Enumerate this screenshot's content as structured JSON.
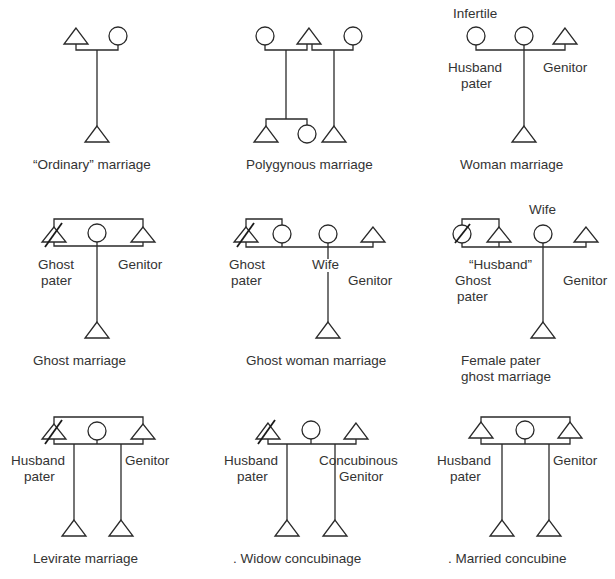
{
  "figure": {
    "type": "kinship-diagrams",
    "colors": {
      "stroke": "#2a2a2a",
      "text": "#333333",
      "background": "#ffffff"
    },
    "panels": [
      {
        "id": "ordinary",
        "caption": "“Ordinary” marriage",
        "labels": []
      },
      {
        "id": "polygynous",
        "caption": "Polygynous marriage",
        "labels": []
      },
      {
        "id": "woman",
        "caption": "Woman marriage",
        "labels": {
          "infertile": "Infertile",
          "husband": "Husband",
          "pater": "pater",
          "genitor": "Genitor"
        }
      },
      {
        "id": "ghost",
        "caption": "Ghost marriage",
        "labels": {
          "ghost": "Ghost",
          "pater": "pater",
          "genitor": "Genitor"
        }
      },
      {
        "id": "ghost-woman",
        "caption": "Ghost woman marriage",
        "labels": {
          "ghost": "Ghost",
          "pater": "pater",
          "wife": "Wife",
          "genitor": "Genitor"
        }
      },
      {
        "id": "female-pater-ghost",
        "caption_line1": "Female pater",
        "caption_line2": "ghost marriage",
        "labels": {
          "wife": "Wife",
          "husband": "“Husband”",
          "ghost": "Ghost",
          "pater": "pater",
          "genitor": "Genitor"
        }
      },
      {
        "id": "levirate",
        "caption": "Levirate marriage",
        "labels": {
          "husband": "Husband",
          "pater": "pater",
          "genitor": "Genitor"
        }
      },
      {
        "id": "widow-concubinage",
        "caption": ".  Widow concubinage",
        "labels": {
          "husband": "Husband",
          "pater": "pater",
          "concubinous": "Concubinous",
          "genitor": "Genitor"
        }
      },
      {
        "id": "married-concubine",
        "caption": ".  Married concubine",
        "labels": {
          "husband": "Husband",
          "pater": "pater",
          "genitor": "Genitor"
        }
      }
    ]
  }
}
